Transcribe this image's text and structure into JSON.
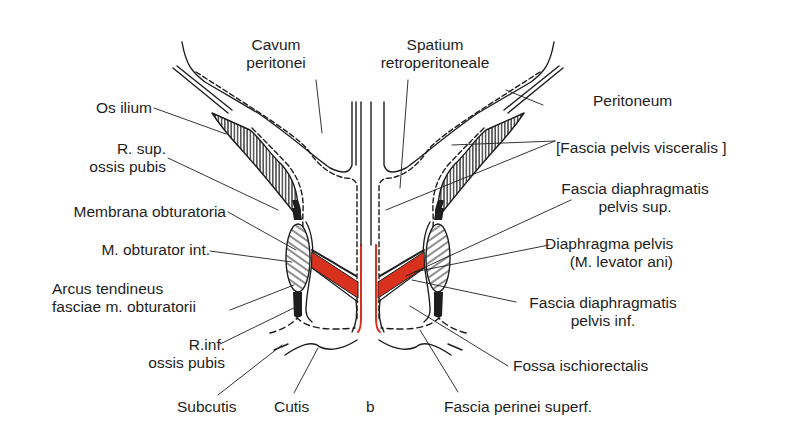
{
  "figure": {
    "panel_letter": "b",
    "colors": {
      "ink": "#1e1e1e",
      "fascia_red": "#d8321e",
      "background": "#ffffff"
    },
    "labels": {
      "cavum_1": "Cavum",
      "cavum_2": "peritonei",
      "spatium_1": "Spatium",
      "spatium_2": "retroperitoneale",
      "peritoneum": "Peritoneum",
      "os_ilium": "Os ilium",
      "r_sup_1": "R. sup.",
      "r_sup_2": "ossis pubis",
      "fascia_visceralis": "[Fascia pelvis visceralis ]",
      "membrana": "Membrana obturatoria",
      "fdps_1": "Fascia diaphragmatis",
      "fdps_2": "pelvis sup.",
      "m_obturator": "M. obturator int.",
      "diaphragma_1": "Diaphragma pelvis",
      "diaphragma_2": "(M. levator ani)",
      "arcus_1": "Arcus tendineus",
      "arcus_2": "fasciae m. obturatorii",
      "fdpi_1": "Fascia diaphragmatis",
      "fdpi_2": "pelvis inf.",
      "r_inf_1": "R.inf.",
      "r_inf_2": "ossis pubis",
      "fossa": "Fossa ischiorectalis",
      "subcutis": "Subcutis",
      "cutis": "Cutis",
      "fascia_perinei": "Fascia perinei superf."
    }
  }
}
